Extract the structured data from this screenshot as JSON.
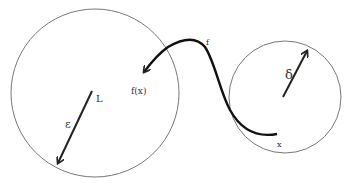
{
  "diagram": {
    "colors": {
      "stroke": "#222222",
      "circle": "#666666",
      "background": "#ffffff"
    },
    "labels": {
      "limit": "L",
      "epsilon": "ε",
      "function_value": "f(x)",
      "function": "f",
      "delta": "δ",
      "point": "x"
    },
    "elements": {
      "epsilon_neighborhood": {
        "center": [
          95,
          93
        ],
        "radius": 84
      },
      "delta_neighborhood": {
        "center": [
          285,
          97
        ],
        "radius": 56
      },
      "mapping_curve": "from x to f(x)"
    }
  }
}
